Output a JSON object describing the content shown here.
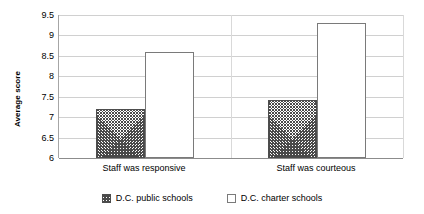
{
  "chart_data": {
    "type": "bar",
    "title": "",
    "subtitle": "",
    "xlabel": "",
    "ylabel": "Average score",
    "ylim": [
      6,
      9.5
    ],
    "ytick_labels": [
      "9.5",
      "9",
      "8.5",
      "8",
      "7.5",
      "7",
      "6.5",
      "6"
    ],
    "ytick_values": [
      9.5,
      9,
      8.5,
      8,
      7.5,
      7,
      6.5,
      6
    ],
    "grid": true,
    "legend_position": "bottom",
    "categories": [
      "Staff was responsive",
      "Staff was courteous"
    ],
    "series": [
      {
        "name": "D.C. public schools",
        "pattern": "diagonal-crosshatch",
        "values": [
          7.2,
          7.43
        ]
      },
      {
        "name": "D.C. charter schools",
        "pattern": "solid-white",
        "values": [
          8.6,
          9.3
        ]
      }
    ]
  },
  "legend": {
    "entries": [
      {
        "label": "D.C. public schools",
        "swatch": "hatched-swatch-icon"
      },
      {
        "label": "D.C. charter schools",
        "swatch": "empty-swatch-icon"
      }
    ]
  }
}
